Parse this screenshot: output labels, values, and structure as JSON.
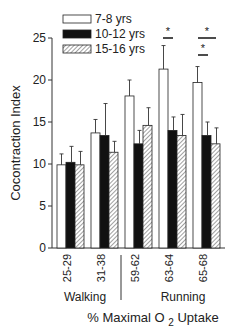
{
  "chart_data": {
    "type": "bar",
    "title": "",
    "xlabel": "% Maximal O 2 Uptake",
    "ylabel": "Cocontraction Index",
    "ylim": [
      0,
      25
    ],
    "yticks": [
      0,
      5,
      10,
      15,
      20,
      25
    ],
    "categories": [
      "25-29",
      "31-38",
      "59-62",
      "63-64",
      "65-68"
    ],
    "category_groups": [
      {
        "label": "Walking",
        "categories": [
          "25-29",
          "31-38"
        ]
      },
      {
        "label": "Running",
        "categories": [
          "59-62",
          "63-64",
          "65-68"
        ]
      }
    ],
    "series": [
      {
        "name": "7-8 yrs",
        "fill": "white",
        "values": [
          9.9,
          13.7,
          18.1,
          21.3,
          19.7
        ],
        "errors": [
          1.3,
          1.6,
          1.9,
          2.8,
          1.9
        ]
      },
      {
        "name": "10-12 yrs",
        "fill": "black",
        "values": [
          10.2,
          13.4,
          12.4,
          14.0,
          13.4
        ],
        "errors": [
          1.9,
          3.8,
          1.6,
          1.6,
          1.6
        ]
      },
      {
        "name": "15-16 yrs",
        "fill": "hatched",
        "values": [
          9.9,
          11.4,
          14.6,
          13.4,
          12.4
        ],
        "errors": [
          1.6,
          1.3,
          2.1,
          2.5,
          1.9
        ]
      }
    ],
    "significance": [
      {
        "category": "63-64",
        "between": [
          "7-8 yrs",
          "10-12 yrs"
        ],
        "label": "*"
      },
      {
        "category": "65-68",
        "between": [
          "7-8 yrs",
          "10-12 yrs"
        ],
        "label": "*"
      },
      {
        "category": "65-68",
        "between": [
          "7-8 yrs",
          "15-16 yrs"
        ],
        "label": "*"
      }
    ],
    "legend_position": "top-left inside",
    "grid": false
  },
  "labels": {
    "ylabel": "Cocontraction Index",
    "xlabel_pre": "% Maximal O",
    "xlabel_sub": "2",
    "xlabel_post": " Uptake",
    "walking": "Walking",
    "running": "Running",
    "legend": [
      "7-8 yrs",
      "10-12 yrs",
      "15-16 yrs"
    ],
    "star": "*"
  }
}
